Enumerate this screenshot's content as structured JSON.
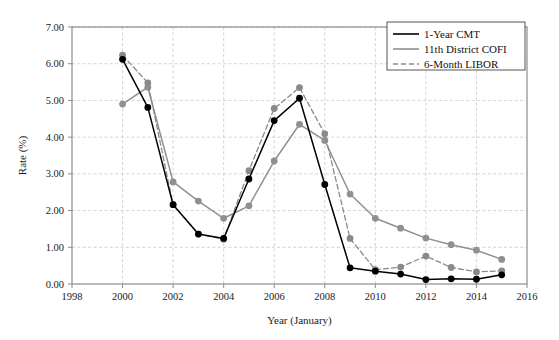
{
  "chart_data": {
    "type": "line",
    "title": "",
    "xlabel": "Year (January)",
    "ylabel": "Rate (%)",
    "xlim": [
      1998,
      2016
    ],
    "ylim": [
      0.0,
      7.0
    ],
    "xticks": [
      1998,
      2000,
      2002,
      2004,
      2006,
      2008,
      2010,
      2012,
      2014,
      2016
    ],
    "xtick_labels": [
      "1998",
      "2000",
      "2002",
      "2004",
      "2006",
      "2008",
      "2010",
      "2012",
      "2014",
      "2016"
    ],
    "yticks": [
      0.0,
      1.0,
      2.0,
      3.0,
      4.0,
      5.0,
      6.0,
      7.0
    ],
    "ytick_labels": [
      "0.00",
      "1.00",
      "2.00",
      "3.00",
      "4.00",
      "5.00",
      "6.00",
      "7.00"
    ],
    "grid": true,
    "grid_style": "dashed",
    "legend_position": "top-right",
    "x": [
      2000,
      2001,
      2002,
      2003,
      2004,
      2005,
      2006,
      2007,
      2008,
      2009,
      2010,
      2011,
      2012,
      2013,
      2014,
      2015
    ],
    "series": [
      {
        "name": "1-Year CMT",
        "color": "#000000",
        "style": "solid",
        "marker": "circle",
        "values": [
          6.12,
          4.81,
          2.16,
          1.36,
          1.24,
          2.86,
          4.45,
          5.06,
          2.71,
          0.44,
          0.35,
          0.27,
          0.12,
          0.14,
          0.13,
          0.25
        ]
      },
      {
        "name": "11th District COFI",
        "color": "#909090",
        "style": "solid",
        "marker": "circle",
        "values": [
          4.9,
          5.36,
          2.78,
          2.26,
          1.79,
          2.13,
          3.35,
          4.35,
          3.91,
          2.45,
          1.79,
          1.52,
          1.25,
          1.07,
          0.92,
          0.67
        ]
      },
      {
        "name": "6-Month LIBOR",
        "color": "#8a8a8a",
        "style": "dashed",
        "marker": "circle",
        "values": [
          6.23,
          5.48,
          2.16,
          1.36,
          1.22,
          3.09,
          4.78,
          5.35,
          4.09,
          1.24,
          0.39,
          0.46,
          0.76,
          0.45,
          0.33,
          0.36
        ]
      }
    ],
    "annotations": []
  },
  "legend": {
    "items": [
      {
        "label": "1-Year CMT"
      },
      {
        "label": "11th District COFI"
      },
      {
        "label": "6-Month LIBOR"
      }
    ]
  },
  "colors": {
    "cmt": "#000000",
    "cofi": "#909090",
    "libor": "#8a8a8a",
    "grid": "#c8c8c8",
    "frame": "#8c8c8c",
    "text": "#1a1a1a"
  }
}
